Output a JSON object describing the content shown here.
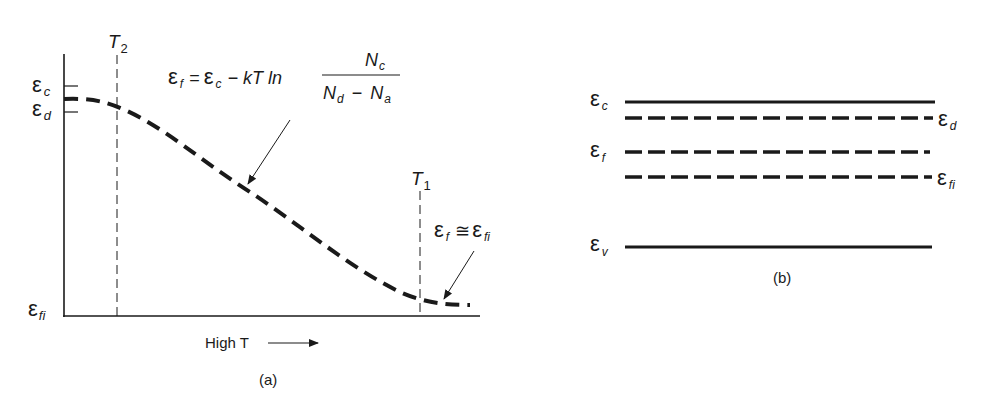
{
  "panel_a": {
    "caption": "(a)",
    "xlabel": "High T",
    "x_arrow": "→",
    "axis_labels": {
      "ec": {
        "sym": "ε",
        "sub": "c"
      },
      "ed": {
        "sym": "ε",
        "sub": "d"
      },
      "efi": {
        "sym": "ε",
        "sub": "fi"
      }
    },
    "temperature_markers": [
      {
        "label": "T",
        "sub": "2"
      },
      {
        "label": "T",
        "sub": "1"
      }
    ],
    "equation_main": {
      "lhs": "ε",
      "lhs_sub": "f",
      "eq": "=",
      "rhs1": "ε",
      "rhs1_sub": "c",
      "minus": "− kT ln",
      "num": "N",
      "num_sub": "c",
      "den1": "N",
      "den1_sub": "d",
      "den_minus": "−",
      "den2": "N",
      "den2_sub": "a"
    },
    "equation_high_t": {
      "lhs": "ε",
      "lhs_sub": "f",
      "approx": "≅",
      "rhs": "ε",
      "rhs_sub": "fi"
    },
    "curve_description": "Fermi level decreasing from near εd at low T toward εfi at high T"
  },
  "panel_b": {
    "caption": "(b)",
    "levels": [
      {
        "name": "conduction-band-edge",
        "sym": "ε",
        "sub": "c",
        "style": "solid",
        "label_side": "left"
      },
      {
        "name": "donor-level",
        "sym": "ε",
        "sub": "d",
        "style": "dashed",
        "label_side": "right"
      },
      {
        "name": "fermi-level",
        "sym": "ε",
        "sub": "f",
        "style": "dashed",
        "label_side": "left"
      },
      {
        "name": "intrinsic-fermi-level",
        "sym": "ε",
        "sub": "fi",
        "style": "dashed",
        "label_side": "right"
      },
      {
        "name": "valence-band-edge",
        "sym": "ε",
        "sub": "v",
        "style": "solid",
        "label_side": "left"
      }
    ]
  }
}
